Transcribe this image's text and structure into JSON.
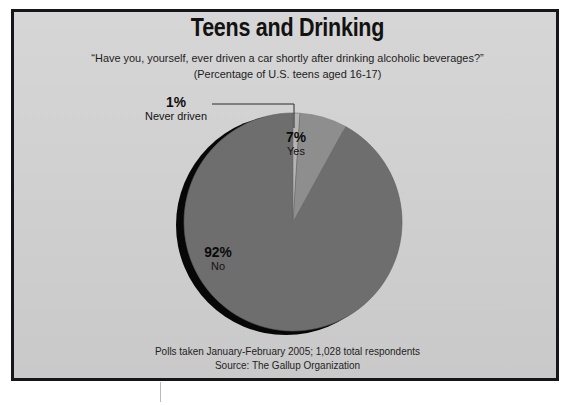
{
  "chart_data": {
    "type": "pie",
    "title": "Teens and Drinking",
    "subtitle": "“Have you, yourself, ever driven a car shortly after drinking alcoholic beverages?”",
    "subtitle2": "(Percentage of U.S. teens aged 16-17)",
    "categories": [
      "Never driven",
      "Yes",
      "No"
    ],
    "values": [
      1,
      7,
      92
    ],
    "value_labels": [
      "1%",
      "7%",
      "92%"
    ],
    "slice_colors": [
      "#b4b4b4",
      "#8e8e8e",
      "#6e6e6e"
    ],
    "start_angle_deg": 0,
    "direction": "clockwise",
    "legend": "none",
    "labels_inline": true,
    "annotations": [
      {
        "id": "never-driven-leader",
        "text": "1% Never driven",
        "type": "leader-line"
      }
    ],
    "source_note": "Polls taken January-February 2005; 1,028 total respondents",
    "source": "Source: The Gallup Organization"
  },
  "slices": [
    {
      "pct": "1%",
      "label": "Never driven"
    },
    {
      "pct": "7%",
      "label": "Yes"
    },
    {
      "pct": "92%",
      "label": "No"
    }
  ],
  "footer": {
    "line1": "Polls taken January-February 2005; 1,028 total respondents",
    "line2": "Source: The Gallup Organization"
  },
  "colors": {
    "background": "#d2d2d2",
    "frame": "#16161a",
    "slice_never": "#b4b4b4",
    "slice_yes": "#8e8e8e",
    "slice_no": "#6e6e6e",
    "shadow": "#060606",
    "text": "#121212"
  }
}
